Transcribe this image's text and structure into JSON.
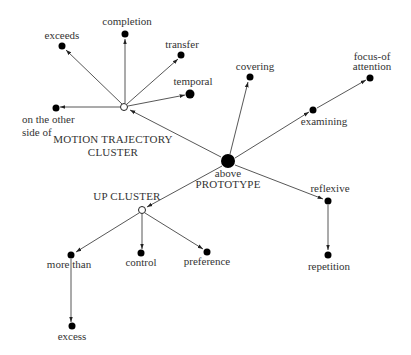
{
  "diagram": {
    "type": "radial-network",
    "colors": {
      "edge": "#444444",
      "node": "#000000",
      "text": "#333333",
      "background": "#ffffff"
    },
    "nodes": [
      {
        "id": "prototype",
        "kind": "prototype",
        "x": 228,
        "y": 161,
        "r": 7,
        "labels": [
          "above",
          "PROTOTYPE"
        ]
      },
      {
        "id": "motion",
        "kind": "cluster",
        "x": 124,
        "y": 107,
        "r": 3.5,
        "labels": [
          "MOTION TRAJECTORY",
          "CLUSTER"
        ]
      },
      {
        "id": "up",
        "kind": "cluster",
        "x": 142,
        "y": 210,
        "r": 3.5,
        "labels": [
          "UP CLUSTER"
        ]
      },
      {
        "id": "exceeds",
        "kind": "sense",
        "x": 62,
        "y": 46,
        "r": 3.5,
        "labels": [
          "exceeds"
        ]
      },
      {
        "id": "completion",
        "kind": "sense",
        "x": 125,
        "y": 35,
        "r": 3.5,
        "labels": [
          "completion"
        ]
      },
      {
        "id": "transfer",
        "kind": "sense",
        "x": 181,
        "y": 55,
        "r": 3.5,
        "labels": [
          "transfer"
        ]
      },
      {
        "id": "temporal",
        "kind": "sense",
        "x": 190,
        "y": 94,
        "r": 4.5,
        "labels": [
          "temporal"
        ]
      },
      {
        "id": "otherside",
        "kind": "sense",
        "x": 56,
        "y": 108,
        "r": 3.5,
        "labels": [
          "on the other",
          "side of"
        ]
      },
      {
        "id": "covering",
        "kind": "sense",
        "x": 250,
        "y": 77,
        "r": 3.5,
        "labels": [
          "covering"
        ]
      },
      {
        "id": "examining",
        "kind": "sense",
        "x": 313,
        "y": 110,
        "r": 3.5,
        "labels": [
          "examining"
        ]
      },
      {
        "id": "focus",
        "kind": "sense",
        "x": 370,
        "y": 78,
        "r": 3.5,
        "labels": [
          "focus-of",
          "attention"
        ]
      },
      {
        "id": "reflexive",
        "kind": "sense",
        "x": 328,
        "y": 201,
        "r": 3.5,
        "labels": [
          "reflexive"
        ]
      },
      {
        "id": "repetition",
        "kind": "sense",
        "x": 328,
        "y": 255,
        "r": 3.5,
        "labels": [
          "repetition"
        ]
      },
      {
        "id": "morethan",
        "kind": "sense",
        "x": 71,
        "y": 255,
        "r": 3.5,
        "labels": [
          "more than"
        ]
      },
      {
        "id": "control",
        "kind": "sense",
        "x": 140,
        "y": 253,
        "r": 3.5,
        "labels": [
          "control"
        ]
      },
      {
        "id": "preference",
        "kind": "sense",
        "x": 207,
        "y": 252,
        "r": 3.5,
        "labels": [
          "preference"
        ]
      },
      {
        "id": "excess",
        "kind": "sense",
        "x": 72,
        "y": 327,
        "r": 3.5,
        "labels": [
          "excess"
        ]
      }
    ],
    "edges": [
      {
        "from": "prototype",
        "to": "motion"
      },
      {
        "from": "prototype",
        "to": "up"
      },
      {
        "from": "prototype",
        "to": "covering"
      },
      {
        "from": "prototype",
        "to": "examining"
      },
      {
        "from": "examining",
        "to": "focus"
      },
      {
        "from": "prototype",
        "to": "reflexive"
      },
      {
        "from": "reflexive",
        "to": "repetition"
      },
      {
        "from": "motion",
        "to": "exceeds"
      },
      {
        "from": "motion",
        "to": "completion"
      },
      {
        "from": "motion",
        "to": "transfer"
      },
      {
        "from": "motion",
        "to": "temporal"
      },
      {
        "from": "motion",
        "to": "otherside"
      },
      {
        "from": "up",
        "to": "morethan"
      },
      {
        "from": "up",
        "to": "control"
      },
      {
        "from": "up",
        "to": "preference"
      },
      {
        "from": "morethan",
        "to": "excess"
      }
    ],
    "labels": {
      "prototype_1": "above",
      "prototype_2": "PROTOTYPE",
      "motion_1": "MOTION TRAJECTORY",
      "motion_2": "CLUSTER",
      "up": "UP CLUSTER",
      "exceeds": "exceeds",
      "completion": "completion",
      "transfer": "transfer",
      "temporal": "temporal",
      "otherside_1": "on the other",
      "otherside_2": "side of",
      "covering": "covering",
      "examining": "examining",
      "focus_1": "focus-of",
      "focus_2": "attention",
      "reflexive": "reflexive",
      "repetition": "repetition",
      "morethan": "more than",
      "control": "control",
      "preference": "preference",
      "excess": "excess"
    }
  }
}
